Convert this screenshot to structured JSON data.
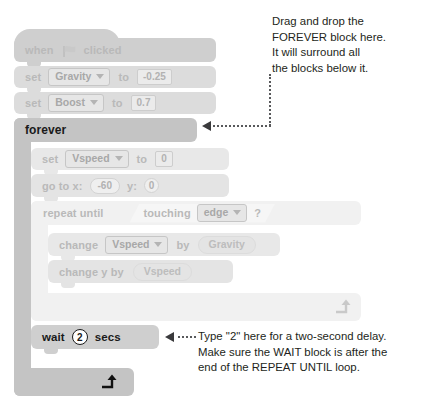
{
  "colors": {
    "block_light": "#dcdcdc",
    "block_lighter": "#f1f1f1",
    "block_forever": "#c4c4c4",
    "text_gray": "#b9b9b9",
    "text_dark": "#1a1a1a",
    "callout": "#58595b",
    "background": "#ffffff"
  },
  "script": {
    "hat": {
      "name": "when-flag-clicked",
      "word_when": "when",
      "icon": "green-flag-icon",
      "word_clicked": "clicked"
    },
    "set_gravity": {
      "name": "set-gravity",
      "word_set": "set",
      "variable": "Gravity",
      "word_to": "to",
      "value": "-0.25"
    },
    "set_boost": {
      "name": "set-boost",
      "word_set": "set",
      "variable": "Boost",
      "word_to": "to",
      "value": "0.7"
    },
    "forever": {
      "name": "forever",
      "label": "forever",
      "loop_arrow": "loop-arrow-icon"
    },
    "set_vspeed": {
      "name": "set-vspeed",
      "word_set": "set",
      "variable": "Vspeed",
      "word_to": "to",
      "value": "0"
    },
    "go_to_xy": {
      "name": "go-to-xy",
      "label_x": "go to x:",
      "x": "-60",
      "label_y": "y:",
      "y": "0"
    },
    "repeat_until": {
      "name": "repeat-until",
      "label": "repeat until",
      "condition": {
        "word_touching": "touching",
        "target": "edge",
        "question": "?"
      },
      "loop_arrow": "loop-arrow-icon"
    },
    "change_vspeed": {
      "name": "change-vspeed-by",
      "word_change": "change",
      "variable": "Vspeed",
      "word_by": "by",
      "value": "Gravity"
    },
    "change_y": {
      "name": "change-y-by",
      "label": "change y by",
      "value": "Vspeed"
    },
    "wait": {
      "name": "wait-secs",
      "word_wait": "wait",
      "value": "2",
      "word_secs": "secs"
    }
  },
  "annotations": {
    "top": {
      "name": "forever-callout",
      "lines": [
        "Drag and drop the",
        "FOREVER block here.",
        "It will surround all",
        "the blocks below it."
      ]
    },
    "bottom": {
      "name": "wait-callout",
      "lines": [
        "Type \"2\" here for a two-second delay.",
        "Make sure the WAIT block is after the",
        "end of the REPEAT UNTIL loop."
      ]
    }
  }
}
